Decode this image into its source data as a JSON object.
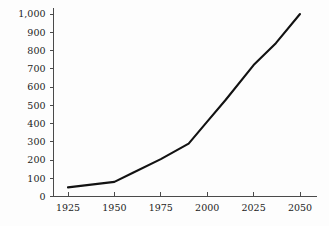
{
  "chart_data": {
    "type": "line",
    "title": "",
    "subtitle": "",
    "xlabel": "",
    "ylabel": "",
    "xlim": [
      1920,
      2055
    ],
    "ylim": [
      0,
      1000
    ],
    "grid": false,
    "legend": false,
    "legend_position": "none",
    "line_color": "#121212",
    "axis_color": "#4a4a4a",
    "background_color": "#fdfdfd",
    "x_ticks": [
      1925,
      1950,
      1975,
      2000,
      2025,
      2050
    ],
    "x_tick_labels": [
      "1925",
      "1950",
      "1975",
      "2000",
      "2025",
      "2050"
    ],
    "y_ticks": [
      0,
      100,
      200,
      300,
      400,
      500,
      600,
      700,
      800,
      900,
      1000
    ],
    "y_tick_labels": [
      "0",
      "100",
      "200",
      "300",
      "400",
      "500",
      "600",
      "700",
      "800",
      "900",
      "1,000"
    ],
    "series": [
      {
        "name": "series-1",
        "x": [
          1925,
          1950,
          1960,
          1975,
          1990,
          2000,
          2010,
          2025,
          2037,
          2050
        ],
        "values": [
          50,
          80,
          130,
          205,
          290,
          410,
          530,
          720,
          840,
          1000
        ]
      }
    ]
  }
}
